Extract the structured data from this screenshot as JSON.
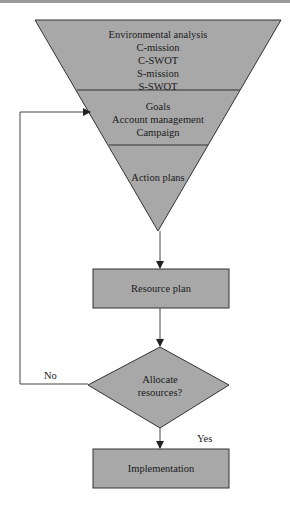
{
  "colors": {
    "fill": "#a8a8a8",
    "stroke": "#333333",
    "line": "#444444",
    "background": "#ffffff"
  },
  "funnel": {
    "sections": [
      {
        "lines": [
          "Environmental analysis",
          "C-mission",
          "C-SWOT",
          "S-mission",
          "S-SWOT"
        ]
      },
      {
        "lines": [
          "Goals",
          "Account management",
          "Campaign"
        ]
      },
      {
        "lines": [
          "Action plans"
        ]
      }
    ]
  },
  "resource_plan": {
    "label": "Resource plan"
  },
  "decision": {
    "lines": [
      "Allocate",
      "resources?"
    ]
  },
  "implementation": {
    "label": "Implementation"
  },
  "edges": {
    "no_label": "No",
    "yes_label": "Yes"
  }
}
